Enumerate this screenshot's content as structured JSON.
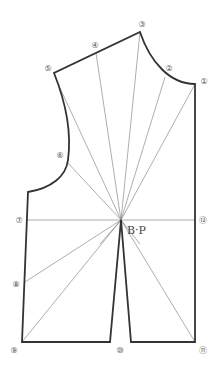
{
  "diagram": {
    "title": "",
    "bust_point_label": "B·P",
    "colors": {
      "outline": "#333333",
      "rays": "#777777",
      "labels": "#555555"
    },
    "points": [
      {
        "id": 1,
        "label": "①",
        "label_x": 204,
        "label_y": 81
      },
      {
        "id": 2,
        "label": "②",
        "label_x": 169,
        "label_y": 68
      },
      {
        "id": 3,
        "label": "③",
        "label_x": 142,
        "label_y": 24
      },
      {
        "id": 4,
        "label": "④",
        "label_x": 95,
        "label_y": 45
      },
      {
        "id": 5,
        "label": "⑤",
        "label_x": 48,
        "label_y": 68
      },
      {
        "id": 6,
        "label": "⑥",
        "label_x": 60,
        "label_y": 155
      },
      {
        "id": 7,
        "label": "⑦",
        "label_x": 19,
        "label_y": 220
      },
      {
        "id": 8,
        "label": "⑧",
        "label_x": 16,
        "label_y": 284
      },
      {
        "id": 9,
        "label": "⑨",
        "label_x": 14,
        "label_y": 350
      },
      {
        "id": 10,
        "label": "⑩",
        "label_x": 120,
        "label_y": 350
      },
      {
        "id": 11,
        "label": "⑪",
        "label_x": 203,
        "label_y": 350
      },
      {
        "id": 12,
        "label": "⑫",
        "label_x": 203,
        "label_y": 220
      }
    ]
  }
}
